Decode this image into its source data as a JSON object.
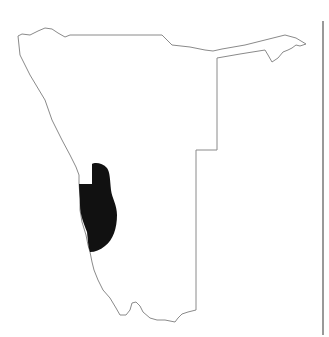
{
  "map": {
    "country": "Namibia",
    "outline_color": "#8a8a8a",
    "highlight_color": "#111111",
    "divider_color": "#555555",
    "background": "#ffffff",
    "highlighted_region": "west-central coastal region",
    "outline_points": "18,36 22,34 30,35 38,31 45,28 52,29 58,33 65,37 70,35 162,35 172,45 190,47 205,50 213,51 222,49 245,45 285,35 296,38 306,44 300,46 296,45 292,48 288,50 283,52 278,58 272,62 268,55 265,50 240,54 217,58 217,150 196,150 196,310 188,312 182,314 178,318 175,322 165,320 157,320 150,318 143,312 140,306 136,302 132,303 130,310 126,315 120,315 116,308 110,298 103,290 98,280 94,270 92,262 90,252 88,245 86,235 82,222 80,210 80,198 79,183 79,175 76,167 70,155 62,140 52,120 45,100 30,75 20,55 18,36",
    "highlight_path": "M92,164 C95,162 103,163 107,168 C110,172 110,180 111,190 C112,198 117,205 117,215 C117,228 113,240 105,246 C100,250 95,252 90,252 C88,247 88,240 87,232 C84,224 80,215 80,205 C80,197 79,190 79,184 L92,184 Z",
    "divider": {
      "x": 323,
      "y1": 21,
      "y2": 335
    }
  }
}
